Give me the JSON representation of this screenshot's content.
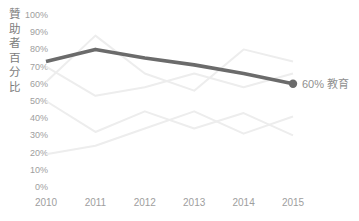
{
  "chart_data": {
    "type": "line",
    "title": "",
    "xlabel": "",
    "ylabel": "贊助者百分比",
    "categories": [
      "2010",
      "2011",
      "2012",
      "2013",
      "2014",
      "2015"
    ],
    "yticks": [
      "0%",
      "10%",
      "20%",
      "30%",
      "40%",
      "50%",
      "60%",
      "70%",
      "80%",
      "90%",
      "100%"
    ],
    "ylim": [
      0,
      100
    ],
    "grid": false,
    "legend": "none",
    "annotation": "highlighted series labeled at right end of line",
    "series": [
      {
        "name": "教育",
        "values": [
          73,
          80,
          75,
          71,
          66,
          60
        ],
        "emphasis": true,
        "end_label": "60% 教育"
      },
      {
        "name": "",
        "values": [
          61,
          88,
          66,
          56,
          80,
          73
        ],
        "emphasis": false
      },
      {
        "name": "",
        "values": [
          70,
          53,
          58,
          66,
          58,
          66
        ],
        "emphasis": false
      },
      {
        "name": "",
        "values": [
          50,
          32,
          44,
          34,
          43,
          30
        ],
        "emphasis": false
      },
      {
        "name": "",
        "values": [
          19,
          24,
          34,
          44,
          31,
          41
        ],
        "emphasis": false
      }
    ],
    "colors": {
      "highlight": "#6b6b6b",
      "background_series": "#ededed",
      "tick_text": "#9e9e9e",
      "end_label_text": "#8f8f8f",
      "axis_title_text": "#7d7d7d",
      "background": "#ffffff"
    }
  }
}
